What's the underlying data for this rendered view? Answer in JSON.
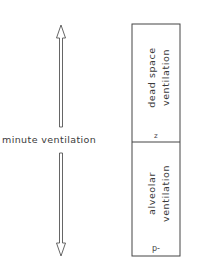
{
  "diagram": {
    "left_label": "minute ventilation",
    "box": {
      "upper": {
        "line1": "dead space",
        "line2": "ventilation",
        "marker": "z"
      },
      "lower": {
        "line1": "alveolar",
        "line2": "ventilation",
        "marker": "p-"
      }
    },
    "colors": {
      "stroke": "#444444",
      "text": "#3a3a3a",
      "background": "#ffffff"
    }
  }
}
